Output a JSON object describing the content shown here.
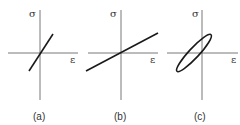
{
  "panels": [
    {
      "id": "a",
      "caption": "(a)",
      "y_label": "σ",
      "x_label": "ε",
      "curve": "steep-line"
    },
    {
      "id": "b",
      "caption": "(b)",
      "y_label": "σ",
      "x_label": "ε",
      "curve": "shallow-line"
    },
    {
      "id": "c",
      "caption": "(c)",
      "y_label": "σ",
      "x_label": "ε",
      "curve": "hysteresis-ellipse"
    }
  ]
}
